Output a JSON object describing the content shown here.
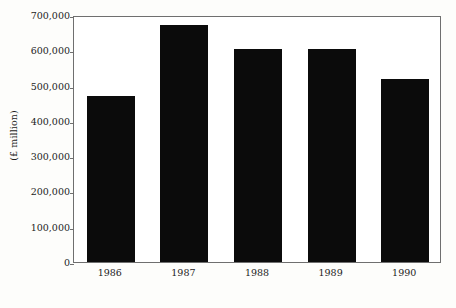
{
  "chart_data": {
    "type": "bar",
    "title": "",
    "subtitle": "",
    "xlabel": "",
    "ylabel": "(£ million)",
    "categories": [
      "1986",
      "1987",
      "1988",
      "1989",
      "1990"
    ],
    "values": [
      470000,
      672000,
      605000,
      603000,
      518000
    ],
    "series": [
      {
        "name": "",
        "values": [
          470000,
          672000,
          605000,
          603000,
          518000
        ]
      }
    ],
    "ylim": [
      0,
      700000
    ],
    "ytick_values": [
      0,
      100000,
      200000,
      300000,
      400000,
      500000,
      600000,
      700000
    ],
    "ytick_labels": [
      "0",
      "100,000",
      "200,000",
      "300,000",
      "400,000",
      "500,000",
      "600,000",
      "700,000"
    ],
    "xtick_labels": [
      "1986",
      "1987",
      "1988",
      "1989",
      "1990"
    ],
    "grid": false,
    "legend": false,
    "legend_position": "none",
    "bar_color": "#0b0b0b",
    "plot_background": "#ffffff",
    "frame_color": "#6f6f6f",
    "text_color": "#1c1c1c"
  }
}
